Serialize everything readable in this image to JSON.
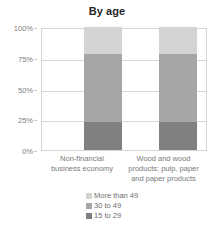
{
  "chart_data": {
    "type": "bar",
    "subtype": "stacked-percentage-column",
    "title": "By age",
    "xlabel": "",
    "ylabel": "",
    "ylim": [
      0,
      100
    ],
    "ytick_labels": [
      "100%",
      "75%",
      "50%",
      "25%",
      "0%"
    ],
    "ytick_values": [
      100,
      75,
      50,
      25,
      0
    ],
    "grid": true,
    "legend_position": "bottom",
    "categories": [
      "Non-financial business economy",
      "Wood and wood products; pulp, paper and paper products"
    ],
    "category_lines": [
      [
        "Non-financial",
        "business economy"
      ],
      [
        "Wood and wood",
        "products; pulp, paper",
        "and paper products"
      ]
    ],
    "series": [
      {
        "name": "More than 49",
        "color": "#d4d4d4",
        "values": [
          22,
          22
        ]
      },
      {
        "name": "30 to 49",
        "color": "#a6a6a6",
        "values": [
          55,
          55
        ]
      },
      {
        "name": "15 to 29",
        "color": "#808080",
        "values": [
          23,
          23
        ]
      }
    ]
  },
  "legend": {
    "items": [
      {
        "label": "More than 49",
        "color": "#d4d4d4"
      },
      {
        "label": "30 to 49",
        "color": "#a6a6a6"
      },
      {
        "label": "15 to 29",
        "color": "#808080"
      }
    ]
  },
  "axis": {
    "ticks": [
      {
        "label": "100%",
        "value": 100
      },
      {
        "label": "75%",
        "value": 75
      },
      {
        "label": "50%",
        "value": 50
      },
      {
        "label": "25%",
        "value": 25
      },
      {
        "label": "0%",
        "value": 0
      }
    ]
  },
  "colors": {
    "plot_border": "#d4d4d4",
    "gridline": "#d9d9d9",
    "title_text": "#262626",
    "axis_text": "#808080",
    "category_text": "#7a7a7a",
    "legend_text": "#6e6e6e",
    "background": "#ffffff"
  }
}
